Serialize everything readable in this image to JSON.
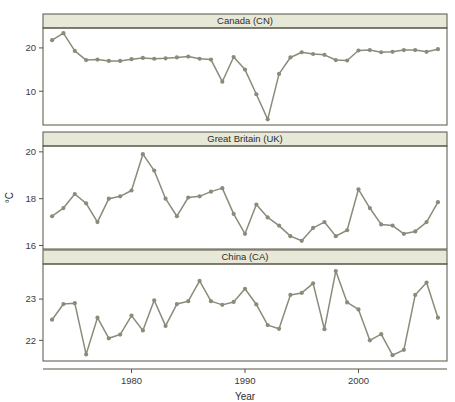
{
  "figure": {
    "xlabel": "Year",
    "ylabel": "°C",
    "line_color": "#8b8b7a",
    "marker_color": "#8b8b7a",
    "strip_fill": "#e8e8d8",
    "strip_border": "#555546",
    "panel_border": "#555546",
    "axis_color": "#555546",
    "background": "#ffffff",
    "xlim": [
      1972.2,
      2007.8
    ],
    "xticks": [
      1980,
      1990,
      2000
    ],
    "xticklabels": [
      "1980",
      "1990",
      "2000"
    ]
  },
  "chart_data": [
    {
      "type": "line",
      "title": "Canada (CN)",
      "xlabel": "Year",
      "ylabel": "°C",
      "ylim": [
        2.2,
        24.6
      ],
      "yticks": [
        10,
        20
      ],
      "yticklabels": [
        "10",
        "20"
      ],
      "grid": false,
      "legend": "none",
      "x": [
        1973,
        1974,
        1975,
        1976,
        1977,
        1978,
        1979,
        1980,
        1981,
        1982,
        1983,
        1984,
        1985,
        1986,
        1987,
        1988,
        1989,
        1990,
        1991,
        1992,
        1993,
        1994,
        1995,
        1996,
        1997,
        1998,
        1999,
        2000,
        2001,
        2002,
        2003,
        2004,
        2005,
        2006,
        2007
      ],
      "values": [
        21.8,
        23.4,
        19.3,
        17.2,
        17.3,
        17.0,
        17.0,
        17.4,
        17.7,
        17.5,
        17.6,
        17.8,
        18.0,
        17.5,
        17.3,
        12.2,
        17.9,
        15.0,
        9.3,
        3.5,
        14.0,
        17.8,
        19.0,
        18.6,
        18.4,
        17.2,
        17.1,
        19.4,
        19.5,
        19.0,
        19.1,
        19.5,
        19.5,
        19.1,
        19.7,
        19.5
      ]
    },
    {
      "type": "line",
      "title": "Great Britain (UK)",
      "xlabel": "Year",
      "ylabel": "°C",
      "ylim": [
        15.85,
        20.25
      ],
      "yticks": [
        16,
        18,
        20
      ],
      "yticklabels": [
        "16",
        "18",
        "20"
      ],
      "grid": false,
      "legend": "none",
      "x": [
        1973,
        1974,
        1975,
        1976,
        1977,
        1978,
        1979,
        1980,
        1981,
        1982,
        1983,
        1984,
        1985,
        1986,
        1987,
        1988,
        1989,
        1990,
        1991,
        1992,
        1993,
        1994,
        1995,
        1996,
        1997,
        1998,
        1999,
        2000,
        2001,
        2002,
        2003,
        2004,
        2005,
        2006,
        2007
      ],
      "values": [
        17.25,
        17.6,
        18.2,
        17.8,
        17.0,
        18.0,
        18.1,
        18.35,
        19.9,
        19.2,
        18.0,
        17.25,
        18.05,
        18.1,
        18.3,
        18.45,
        17.35,
        16.5,
        17.75,
        17.2,
        16.85,
        16.4,
        16.2,
        16.75,
        17.0,
        16.4,
        16.65,
        18.4,
        17.6,
        16.9,
        16.85,
        16.5,
        16.6,
        17.0,
        17.85,
        17.8
      ]
    },
    {
      "type": "line",
      "title": "China (CA)",
      "xlabel": "Year",
      "ylabel": "°C",
      "ylim": [
        21.5,
        23.85
      ],
      "yticks": [
        22,
        23
      ],
      "yticklabels": [
        "22",
        "23"
      ],
      "grid": false,
      "legend": "none",
      "x": [
        1973,
        1974,
        1975,
        1976,
        1977,
        1978,
        1979,
        1980,
        1981,
        1982,
        1983,
        1984,
        1985,
        1986,
        1987,
        1988,
        1989,
        1990,
        1991,
        1992,
        1993,
        1994,
        1995,
        1996,
        1997,
        1998,
        1999,
        2000,
        2001,
        2002,
        2003,
        2004,
        2005,
        2006,
        2007
      ],
      "values": [
        22.5,
        22.88,
        22.9,
        21.66,
        22.55,
        22.05,
        22.14,
        22.6,
        22.24,
        22.97,
        22.35,
        22.88,
        22.95,
        23.44,
        22.95,
        22.86,
        22.93,
        23.25,
        22.87,
        22.37,
        22.28,
        23.1,
        23.15,
        23.38,
        22.27,
        23.68,
        22.92,
        22.75,
        22.0,
        22.15,
        21.64,
        21.77,
        23.1,
        23.4,
        22.55
      ]
    }
  ]
}
